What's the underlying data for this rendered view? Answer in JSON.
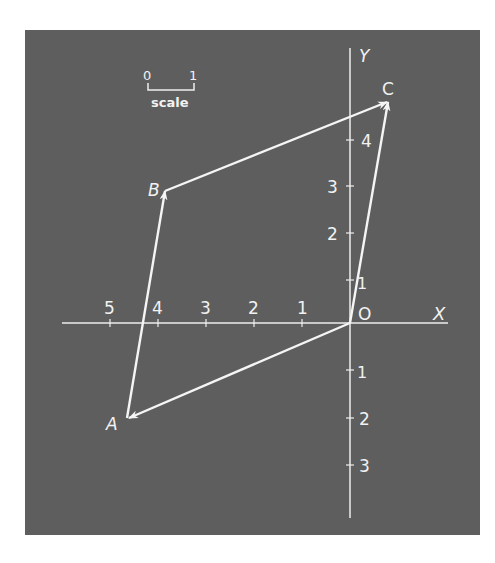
{
  "diagram": {
    "type": "vector-parallelogram",
    "axes": {
      "x_label": "X",
      "y_label": "Y",
      "origin_label": "O"
    },
    "x_ticks": [
      "5",
      "4",
      "3",
      "2",
      "1"
    ],
    "y_ticks_pos": [
      "1",
      "2",
      "3",
      "4"
    ],
    "y_ticks_neg": [
      "1",
      "2",
      "3"
    ],
    "scale": {
      "left": "0",
      "right": "1",
      "label": "scale"
    },
    "points": [
      {
        "name": "A",
        "x": -4.6,
        "y": -2.0
      },
      {
        "name": "B",
        "x": -3.85,
        "y": 2.8
      },
      {
        "name": "C",
        "x": 0.8,
        "y": 4.7
      },
      {
        "name": "O",
        "x": 0,
        "y": 0
      }
    ],
    "vectors": [
      {
        "from": "O",
        "to": "A"
      },
      {
        "from": "A",
        "to": "B"
      },
      {
        "from": "B",
        "to": "C"
      },
      {
        "from": "O",
        "to": "C"
      }
    ]
  }
}
